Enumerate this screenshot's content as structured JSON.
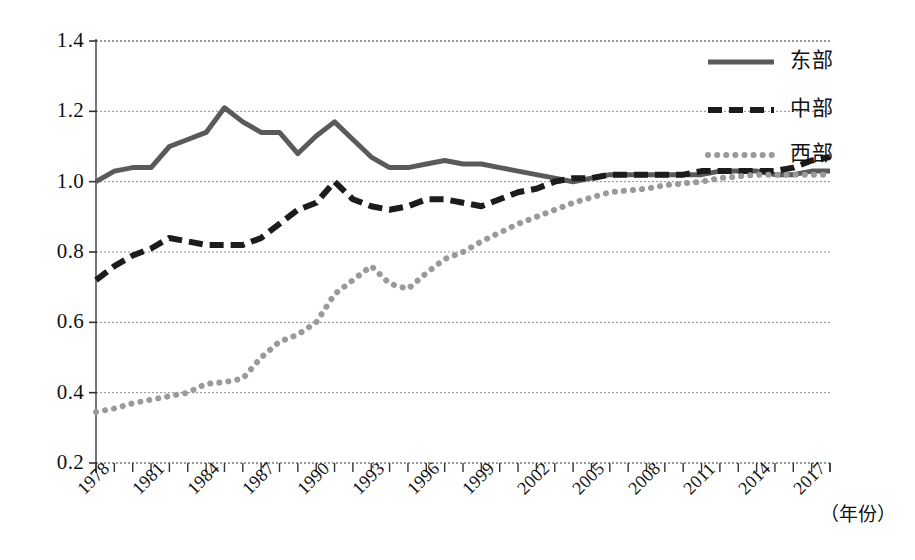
{
  "chart_data": {
    "type": "line",
    "title": "",
    "xlabel": "（年份）",
    "ylabel": "",
    "xlim": [
      1978,
      2017
    ],
    "ylim": [
      0.2,
      1.4
    ],
    "yticks": [
      "1.4",
      "1.2",
      "1.0",
      "0.8",
      "0.6",
      "0.4",
      "0.2"
    ],
    "ytick_values": [
      1.4,
      1.2,
      1.0,
      0.8,
      0.6,
      0.4,
      0.2
    ],
    "xticks": [
      "1978",
      "1981",
      "1984",
      "1987",
      "1990",
      "1993",
      "1996",
      "1999",
      "2002",
      "2005",
      "2008",
      "2011",
      "2014",
      "2017"
    ],
    "xtick_values": [
      1978,
      1981,
      1984,
      1987,
      1990,
      1993,
      1996,
      1999,
      2002,
      2005,
      2008,
      2011,
      2014,
      2017
    ],
    "x": [
      1978,
      1979,
      1980,
      1981,
      1982,
      1983,
      1984,
      1985,
      1986,
      1987,
      1988,
      1989,
      1990,
      1991,
      1992,
      1993,
      1994,
      1995,
      1996,
      1997,
      1998,
      1999,
      2000,
      2001,
      2002,
      2003,
      2004,
      2005,
      2006,
      2007,
      2008,
      2009,
      2010,
      2011,
      2012,
      2013,
      2014,
      2015,
      2016,
      2017,
      2018
    ],
    "grid": true,
    "legend_position": "top-right",
    "series": [
      {
        "name": "东部",
        "style": "solid",
        "color": "#5a5a5a",
        "values": [
          1.0,
          1.03,
          1.04,
          1.04,
          1.1,
          1.12,
          1.14,
          1.21,
          1.17,
          1.14,
          1.14,
          1.08,
          1.13,
          1.17,
          1.12,
          1.07,
          1.04,
          1.04,
          1.05,
          1.06,
          1.05,
          1.05,
          1.04,
          1.03,
          1.02,
          1.01,
          1.0,
          1.01,
          1.02,
          1.02,
          1.02,
          1.02,
          1.02,
          1.02,
          1.03,
          1.03,
          1.03,
          1.02,
          1.02,
          1.03,
          1.03
        ]
      },
      {
        "name": "中部",
        "style": "dashed",
        "color": "#1c1c1c",
        "values": [
          0.72,
          0.76,
          0.79,
          0.81,
          0.84,
          0.83,
          0.82,
          0.82,
          0.82,
          0.84,
          0.88,
          0.92,
          0.94,
          1.0,
          0.95,
          0.93,
          0.92,
          0.93,
          0.95,
          0.95,
          0.94,
          0.93,
          0.95,
          0.97,
          0.98,
          1.0,
          1.01,
          1.01,
          1.02,
          1.02,
          1.02,
          1.02,
          1.02,
          1.03,
          1.03,
          1.03,
          1.03,
          1.03,
          1.04,
          1.06,
          1.07
        ]
      },
      {
        "name": "西部",
        "style": "dotted",
        "color": "#9a9a9a",
        "values": [
          0.345,
          0.355,
          0.37,
          0.38,
          0.39,
          0.4,
          0.425,
          0.43,
          0.44,
          0.5,
          0.545,
          0.565,
          0.6,
          0.68,
          0.72,
          0.76,
          0.71,
          0.695,
          0.74,
          0.78,
          0.8,
          0.83,
          0.855,
          0.88,
          0.9,
          0.92,
          0.94,
          0.955,
          0.97,
          0.975,
          0.98,
          0.99,
          0.995,
          1.0,
          1.01,
          1.015,
          1.02,
          1.02,
          1.02,
          1.02,
          1.02
        ]
      }
    ]
  },
  "legend": {
    "items": [
      {
        "label": "东部",
        "style": "solid"
      },
      {
        "label": "中部",
        "style": "dashed"
      },
      {
        "label": "西部",
        "style": "dotted"
      }
    ]
  },
  "axis": {
    "x_unit_label": "（年份）"
  }
}
